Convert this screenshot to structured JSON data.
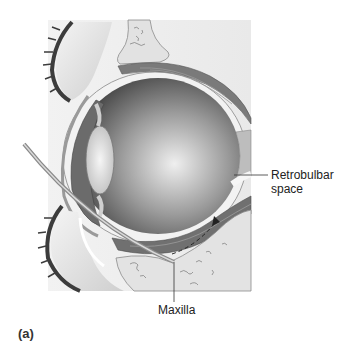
{
  "figure": {
    "panel_label": "(a)",
    "labels": {
      "retrobulbar_line1": "Retrobulbar",
      "retrobulbar_line2": "space",
      "maxilla": "Maxilla"
    },
    "colors": {
      "background": "#ffffff",
      "globe_dark": "#5a5a5a",
      "globe_light": "#e8e8e8",
      "bone": "#e6e6e6",
      "muscle": "#6e6e6e",
      "eyelid_lashes": "#3c3c3c",
      "tissue": "#d8d8d8"
    }
  }
}
